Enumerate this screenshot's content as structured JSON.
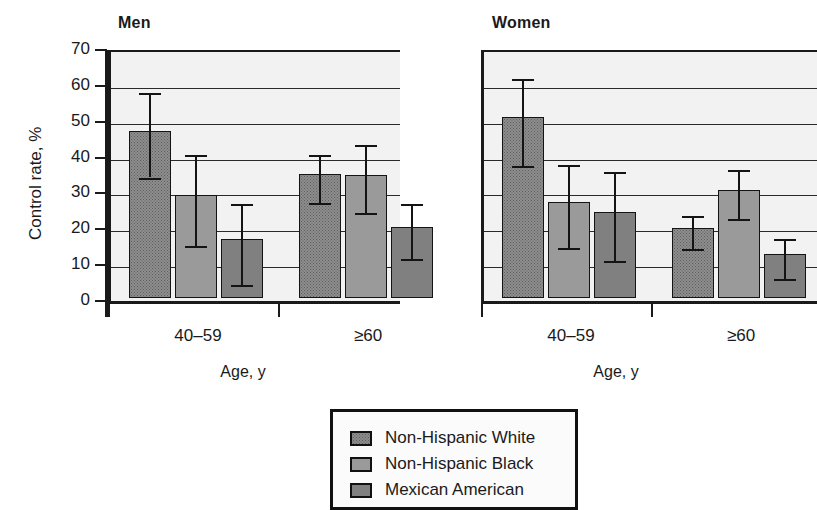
{
  "figure": {
    "background": "#ffffff",
    "plot_background": "#f2f2f2",
    "axis_color": "#1a1a1a"
  },
  "chart_data": {
    "type": "bar",
    "title": "",
    "panels": [
      {
        "title": "Men",
        "xlabel": "Age, y",
        "ylabel": "Control rate, %",
        "categories": [
          "40–59",
          "≥60"
        ],
        "series": [
          {
            "name": "Non-Hispanic White",
            "color": "#8e8e8e",
            "values": [
              46.5,
              34.6
            ],
            "err_low": [
              35.0,
              28.0
            ],
            "err_high": [
              58.5,
              41.2
            ]
          },
          {
            "name": "Non-Hispanic Black",
            "color": "#9a9a9a",
            "values": [
              28.7,
              34.4
            ],
            "err_low": [
              16.0,
              25.0
            ],
            "err_high": [
              41.4,
              44.2
            ]
          },
          {
            "name": "Mexican American",
            "color": "#808080",
            "values": [
              16.5,
              19.9
            ],
            "err_low": [
              5.0,
              12.2
            ],
            "err_high": [
              27.7,
              27.7
            ]
          }
        ]
      },
      {
        "title": "Women",
        "xlabel": "Age, y",
        "ylabel": "",
        "categories": [
          "40–59",
          "≥60"
        ],
        "series": [
          {
            "name": "Non-Hispanic White",
            "color": "#8e8e8e",
            "values": [
              50.5,
              19.5
            ],
            "err_low": [
              38.2,
              15.0
            ],
            "err_high": [
              62.6,
              24.2
            ]
          },
          {
            "name": "Non-Hispanic Black",
            "color": "#9a9a9a",
            "values": [
              26.8,
              30.2
            ],
            "err_low": [
              15.2,
              23.3
            ],
            "err_high": [
              38.5,
              37.0
            ]
          },
          {
            "name": "Mexican American",
            "color": "#808080",
            "values": [
              24.1,
              12.3
            ],
            "err_low": [
              11.8,
              6.8
            ],
            "err_high": [
              36.4,
              17.9
            ]
          }
        ]
      }
    ],
    "yticks": [
      70,
      60,
      50,
      40,
      30,
      20,
      10,
      0
    ],
    "ylim": [
      0,
      70
    ],
    "grid": true,
    "legend_position": "bottom-center",
    "legend_entries": [
      "Non-Hispanic White",
      "Non-Hispanic Black",
      "Mexican American"
    ]
  },
  "legend": {
    "items": [
      {
        "label": "Non-Hispanic White",
        "swatch": "nhw"
      },
      {
        "label": "Non-Hispanic Black",
        "swatch": "nhb"
      },
      {
        "label": "Mexican American",
        "swatch": "ma"
      }
    ]
  }
}
